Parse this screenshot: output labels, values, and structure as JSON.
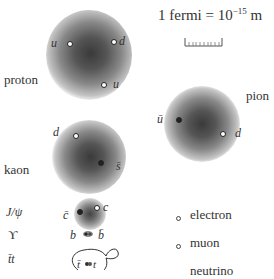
{
  "scale": {
    "label": "1 fermi = 10",
    "exponent": "−15",
    "unit": " m"
  },
  "proton": {
    "label": "proton",
    "quarks": [
      "u",
      "d",
      "u"
    ]
  },
  "pion": {
    "label": "pion",
    "quarks": [
      "ū",
      "d"
    ]
  },
  "kaon": {
    "label": "kaon",
    "quarks": [
      "d",
      "s̄"
    ]
  },
  "jpsi": {
    "label": "J/ψ",
    "quarks": [
      "c̄",
      "c"
    ]
  },
  "upsilon": {
    "label": "ϒ",
    "quarks": [
      "b",
      "b̄"
    ]
  },
  "ttbar": {
    "label": "t̄t",
    "quarks": [
      "t̄",
      "t"
    ]
  },
  "legend": {
    "items": [
      "electron",
      "muon",
      "neutrino"
    ]
  }
}
